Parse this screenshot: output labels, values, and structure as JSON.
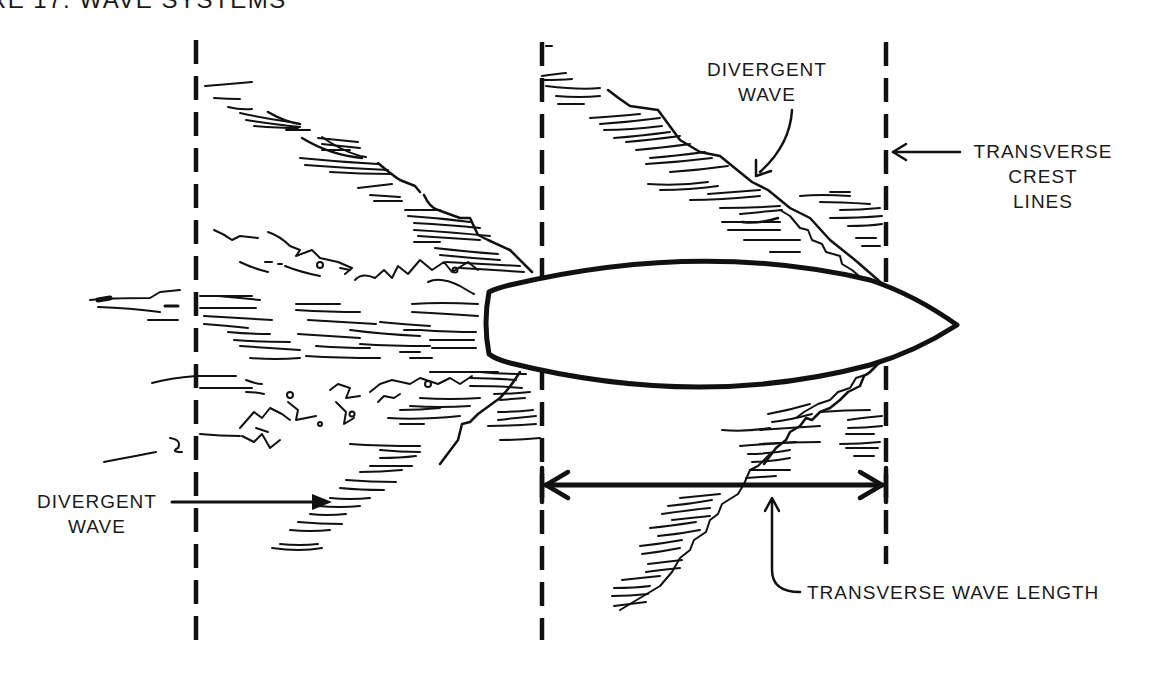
{
  "figure": {
    "title": "URE 17. WAVE SYSTEMS",
    "colors": {
      "ink": "#111111",
      "background": "#ffffff"
    }
  },
  "labels": {
    "divergent_wave_top": {
      "line1": "DIVERGENT",
      "line2": "WAVE"
    },
    "transverse_crest_lines": {
      "line1": "TRANSVERSE",
      "line2": "CREST",
      "line3": "LINES"
    },
    "divergent_wave_left": {
      "line1": "DIVERGENT",
      "line2": "WAVE"
    },
    "transverse_wave_length": "TRANSVERSE WAVE LENGTH"
  },
  "elements": {
    "hull": "boat-hull-plan-view",
    "crest_lines": [
      "left-crest-line",
      "middle-crest-line",
      "right-crest-line"
    ],
    "dimension": "transverse-wave-length-arrow"
  }
}
